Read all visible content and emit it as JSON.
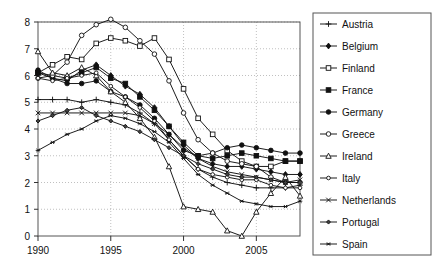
{
  "chart_data": {
    "type": "line",
    "title": "",
    "xlabel": "",
    "ylabel": "",
    "xlim": [
      1990,
      2008
    ],
    "ylim": [
      0,
      8
    ],
    "grid": true,
    "legend_position": "right",
    "x_ticks": [
      "1990",
      "1995",
      "2000",
      "2005"
    ],
    "x_tick_values": [
      1990,
      1995,
      2000,
      2005
    ],
    "y_ticks": [
      "0",
      "1",
      "2",
      "3",
      "4",
      "5",
      "6",
      "7",
      "8"
    ],
    "y_tick_values": [
      0,
      1,
      2,
      3,
      4,
      5,
      6,
      7,
      8
    ],
    "x": [
      1990,
      1991,
      1992,
      1993,
      1994,
      1995,
      1996,
      1997,
      1998,
      1999,
      2000,
      2001,
      2002,
      2003,
      2004,
      2005,
      2006,
      2007,
      2008
    ],
    "series": [
      {
        "name": "Austria",
        "marker": "plus",
        "values": [
          5.1,
          5.1,
          5.1,
          5.0,
          5.1,
          5.0,
          4.9,
          4.6,
          4.2,
          3.6,
          3.0,
          2.5,
          2.2,
          2.0,
          1.9,
          1.8,
          1.8,
          1.8,
          1.9
        ]
      },
      {
        "name": "Belgium",
        "marker": "filled-diamond",
        "values": [
          6.1,
          5.9,
          5.8,
          6.2,
          6.4,
          6.0,
          5.6,
          5.3,
          4.8,
          4.1,
          3.4,
          2.9,
          2.7,
          2.6,
          2.6,
          2.5,
          2.4,
          2.3,
          2.3
        ]
      },
      {
        "name": "Finland",
        "marker": "open-square",
        "values": [
          6.1,
          6.4,
          6.7,
          6.6,
          7.2,
          7.4,
          7.3,
          7.1,
          7.4,
          6.6,
          5.5,
          4.4,
          3.8,
          3.2,
          2.8,
          2.6,
          2.6,
          2.8,
          2.8
        ]
      },
      {
        "name": "France",
        "marker": "filled-square",
        "values": [
          6.1,
          6.0,
          5.9,
          6.1,
          6.3,
          5.9,
          5.7,
          5.2,
          4.7,
          4.1,
          3.5,
          3.0,
          2.9,
          3.0,
          3.1,
          3.0,
          2.9,
          2.8,
          2.8
        ]
      },
      {
        "name": "Germany",
        "marker": "filled-circle",
        "values": [
          6.2,
          5.9,
          5.7,
          5.7,
          5.8,
          5.4,
          5.2,
          4.9,
          4.4,
          3.8,
          3.2,
          3.0,
          3.1,
          3.3,
          3.4,
          3.3,
          3.2,
          3.1,
          3.1
        ]
      },
      {
        "name": "Greece",
        "marker": "open-circle",
        "values": [
          5.9,
          6.0,
          6.5,
          7.5,
          7.9,
          8.1,
          7.8,
          7.3,
          6.8,
          5.8,
          4.6,
          3.6,
          3.1,
          2.8,
          2.7,
          2.6,
          2.2,
          2.0,
          2.0
        ]
      },
      {
        "name": "Ireland",
        "marker": "open-triangle",
        "values": [
          6.9,
          6.1,
          6.0,
          6.3,
          6.0,
          5.4,
          5.0,
          4.4,
          3.7,
          2.6,
          1.1,
          1.0,
          0.9,
          0.2,
          0.0,
          0.9,
          1.6,
          2.2,
          1.5
        ]
      },
      {
        "name": "Italy",
        "marker": "open-circle-small",
        "values": [
          5.9,
          5.8,
          5.9,
          6.0,
          6.1,
          5.6,
          5.2,
          4.8,
          4.3,
          3.6,
          3.0,
          2.5,
          2.3,
          2.2,
          2.1,
          2.1,
          1.9,
          1.8,
          1.8
        ]
      },
      {
        "name": "Netherlands",
        "marker": "cross-x",
        "values": [
          4.6,
          4.6,
          4.6,
          4.6,
          4.6,
          4.6,
          4.6,
          4.5,
          4.2,
          3.8,
          3.3,
          2.9,
          2.6,
          2.4,
          2.3,
          2.2,
          2.1,
          2.0,
          2.1
        ]
      },
      {
        "name": "Portugal",
        "marker": "filled-diamond-small",
        "values": [
          4.3,
          4.5,
          4.7,
          4.8,
          4.5,
          4.3,
          4.1,
          3.9,
          3.6,
          3.3,
          3.0,
          2.7,
          2.5,
          2.3,
          2.2,
          2.2,
          2.1,
          2.0,
          2.0
        ]
      },
      {
        "name": "Spain",
        "marker": "asterisk",
        "values": [
          3.2,
          3.5,
          3.8,
          4.0,
          4.3,
          4.5,
          4.4,
          4.2,
          3.9,
          3.5,
          2.9,
          2.3,
          1.9,
          1.6,
          1.3,
          1.2,
          1.1,
          1.1,
          1.3
        ]
      }
    ]
  }
}
